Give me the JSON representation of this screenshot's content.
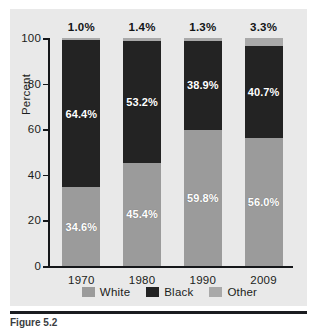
{
  "chart_data": {
    "type": "bar",
    "subtype": "stacked-bar-100-percent",
    "title": "",
    "xlabel": "",
    "ylabel": "Percent",
    "ylim": [
      0,
      100
    ],
    "yticks": [
      0,
      20,
      40,
      60,
      80,
      100
    ],
    "ytick_labels": [
      "0",
      "20",
      "40",
      "60",
      "80",
      "100"
    ],
    "grid": false,
    "legend_position": "bottom",
    "categories": [
      "1970",
      "1980",
      "1990",
      "2009"
    ],
    "series": [
      {
        "name": "White",
        "color": "#9b9b9b",
        "values": [
          34.6,
          45.4,
          59.8,
          56.0
        ],
        "labels": [
          "34.6%",
          "45.4%",
          "59.8%",
          "56.0%"
        ]
      },
      {
        "name": "Black",
        "color": "#232323",
        "values": [
          64.4,
          53.2,
          38.9,
          40.7
        ],
        "labels": [
          "64.4%",
          "53.2%",
          "38.9%",
          "40.7%"
        ]
      },
      {
        "name": "Other",
        "color": "#a9a9a9",
        "values": [
          1.0,
          1.4,
          1.3,
          3.3
        ],
        "labels": [
          "1.0%",
          "1.4%",
          "1.3%",
          "3.3%"
        ]
      }
    ],
    "top_labels": [
      "1.0%",
      "1.4%",
      "1.3%",
      "3.3%"
    ]
  },
  "axis": {
    "y_title": "Percent",
    "y_ticks": [
      "100",
      "80",
      "60",
      "40",
      "20",
      "0"
    ],
    "x_ticks": [
      "1970",
      "1980",
      "1990",
      "2009"
    ]
  },
  "legend": {
    "items": [
      {
        "label": "White",
        "color": "#9b9b9b"
      },
      {
        "label": "Black",
        "color": "#232323"
      },
      {
        "label": "Other",
        "color": "#a9a9a9"
      }
    ]
  },
  "bars": [
    {
      "year": "1970",
      "top_label": "1.0%",
      "segments": [
        {
          "name": "White",
          "value": 34.6,
          "label": "34.6%",
          "show_label": true
        },
        {
          "name": "Black",
          "value": 64.4,
          "label": "64.4%",
          "show_label": true
        },
        {
          "name": "Other",
          "value": 1.0,
          "label": "1.0%",
          "show_label": false
        }
      ]
    },
    {
      "year": "1980",
      "top_label": "1.4%",
      "segments": [
        {
          "name": "White",
          "value": 45.4,
          "label": "45.4%",
          "show_label": true
        },
        {
          "name": "Black",
          "value": 53.2,
          "label": "53.2%",
          "show_label": true
        },
        {
          "name": "Other",
          "value": 1.4,
          "label": "1.4%",
          "show_label": false
        }
      ]
    },
    {
      "year": "1990",
      "top_label": "1.3%",
      "segments": [
        {
          "name": "White",
          "value": 59.8,
          "label": "59.8%",
          "show_label": true
        },
        {
          "name": "Black",
          "value": 38.9,
          "label": "38.9%",
          "show_label": true
        },
        {
          "name": "Other",
          "value": 1.3,
          "label": "1.3%",
          "show_label": false
        }
      ]
    },
    {
      "year": "2009",
      "top_label": "3.3%",
      "segments": [
        {
          "name": "White",
          "value": 56.0,
          "label": "56.0%",
          "show_label": true
        },
        {
          "name": "Black",
          "value": 40.7,
          "label": "40.7%",
          "show_label": true
        },
        {
          "name": "Other",
          "value": 3.3,
          "label": "3.3%",
          "show_label": false
        }
      ]
    }
  ],
  "caption": {
    "prefix": "Figure",
    "number": "5.2",
    "text": ""
  },
  "colors": {
    "panel_background": "#e9e9e9",
    "axis": "#15171a",
    "white_segment": "#9b9b9b",
    "black_segment": "#232323",
    "other_segment": "#a9a9a9",
    "text": "#1b1d20"
  }
}
